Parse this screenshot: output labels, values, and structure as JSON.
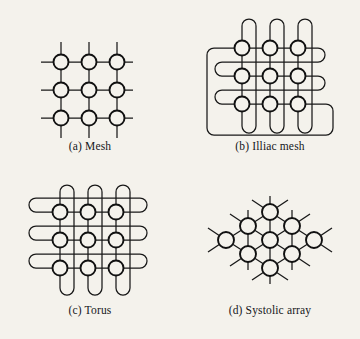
{
  "figure": {
    "background_color": "#f4f2ec",
    "line_color": "#181818",
    "node_fill": "#f4f2ec",
    "node_stroke": "#111111"
  },
  "panels": [
    {
      "id": "mesh",
      "caption": "(a) Mesh",
      "node_count": 9,
      "grid": "3x3",
      "description": "Two-dimensional mesh with open boundary stubs"
    },
    {
      "id": "illiac-mesh",
      "caption": "(b) Illiac mesh",
      "node_count": 9,
      "grid": "3x3",
      "description": "Mesh with column wrap-around and row-shifted chordal wrap-around links"
    },
    {
      "id": "torus",
      "caption": "(c) Torus",
      "node_count": 9,
      "grid": "3x3",
      "description": "Mesh with row and column wrap-around links"
    },
    {
      "id": "systolic-array",
      "caption": "(d) Systolic array",
      "node_count": 9,
      "grid": "diamond 1-2-3-2-1",
      "description": "Hexagonally connected diamond array with external stubs"
    }
  ]
}
